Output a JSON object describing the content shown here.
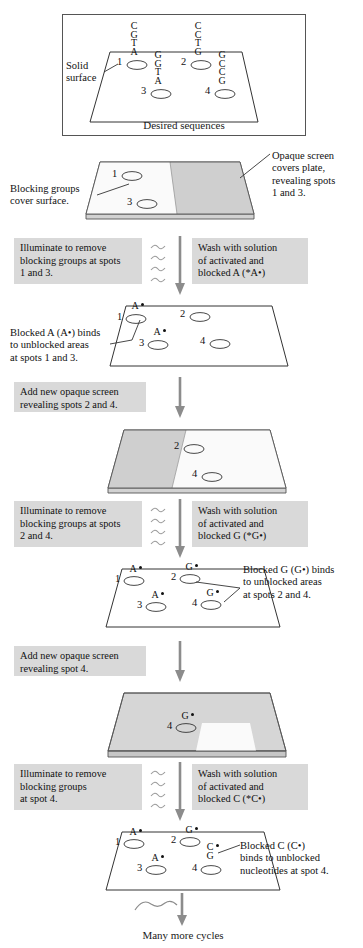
{
  "figure": {
    "bottom_note": "Many more cycles"
  },
  "panel1": {
    "name": "desired-sequences-panel",
    "caption": "Desired sequences",
    "label_solid_surface": "Solid\nsurface",
    "label_solid_surface_line1": "Solid",
    "label_solid_surface_line2": "surface",
    "spots": [
      {
        "id": "1",
        "number": "1",
        "sequence": "C\nG\nT\nA"
      },
      {
        "id": "2",
        "number": "2",
        "sequence": "C\nC\nT\nG"
      },
      {
        "id": "3",
        "number": "3",
        "sequence": "G\nG\nT\nA"
      },
      {
        "id": "4",
        "number": "4",
        "sequence": "G\nC\nC\nG"
      }
    ]
  },
  "panel2": {
    "name": "first-mask-panel",
    "label_blocking_line1": "Blocking groups",
    "label_blocking_line2": "cover surface.",
    "label_screen_line1": "Opaque screen",
    "label_screen_line2": "covers plate,",
    "label_screen_line3": "revealing spots",
    "label_screen_line4": "1 and 3.",
    "spots": [
      {
        "number": "1"
      },
      {
        "number": "3"
      }
    ]
  },
  "step1": {
    "illuminate_line1": "Illuminate to remove",
    "illuminate_line2": "blocking groups at spots",
    "illuminate_line3": "1 and 3.",
    "wash_line1": "Wash with solution",
    "wash_line2": "of activated and",
    "wash_line3": "blocked A (*A•)"
  },
  "panel3": {
    "name": "a-bound-panel",
    "label_line1": "Blocked A (A•) binds",
    "label_line2": "to unblocked areas",
    "label_line3": "at spots 1 and 3.",
    "spots": [
      {
        "number": "1",
        "base": "A",
        "dot": true
      },
      {
        "number": "2",
        "base": "",
        "dot": false
      },
      {
        "number": "3",
        "base": "A",
        "dot": true
      },
      {
        "number": "4",
        "base": "",
        "dot": false
      }
    ]
  },
  "step2": {
    "box_line1": "Add new opaque screen",
    "box_line2": "revealing spots 2 and 4."
  },
  "panel4": {
    "name": "second-mask-panel",
    "spots": [
      {
        "number": "2"
      },
      {
        "number": "4"
      }
    ]
  },
  "step3": {
    "illuminate_line1": "Illuminate to remove",
    "illuminate_line2": "blocking groups at spots",
    "illuminate_line3": "2 and 4.",
    "wash_line1": "Wash with solution",
    "wash_line2": "of activated and",
    "wash_line3": "blocked G (*G•)"
  },
  "panel5": {
    "name": "g-bound-panel",
    "label_line1": "Blocked G (G•) binds",
    "label_line2": "to unblocked areas",
    "label_line3": "at spots 2 and 4.",
    "spots": [
      {
        "number": "1",
        "base": "A",
        "dot": true
      },
      {
        "number": "2",
        "base": "G",
        "dot": true
      },
      {
        "number": "3",
        "base": "A",
        "dot": true
      },
      {
        "number": "4",
        "base": "G",
        "dot": true
      }
    ]
  },
  "step4": {
    "box_line1": "Add new opaque screen",
    "box_line2": "revealing spot 4."
  },
  "panel6": {
    "name": "third-mask-panel",
    "spots": [
      {
        "number": "4",
        "base": "G",
        "dot": true
      }
    ]
  },
  "step5": {
    "illuminate_line1": "Illuminate to remove",
    "illuminate_line2": "blocking groups",
    "illuminate_line3": "at spot 4.",
    "wash_line1": "Wash with solution",
    "wash_line2": "of activated and",
    "wash_line3": "blocked C (*C•)"
  },
  "panel7": {
    "name": "c-bound-panel",
    "label_line1": "Blocked C (C•)",
    "label_line2": "binds to unblocked",
    "label_line3": "nucleotides at spot 4.",
    "spots": [
      {
        "number": "1",
        "base": "A",
        "dot": true
      },
      {
        "number": "2",
        "base": "G",
        "dot": true
      },
      {
        "number": "3",
        "base": "A",
        "dot": true
      },
      {
        "number": "4",
        "base": "C\nG",
        "dot": true
      }
    ]
  },
  "colors": {
    "box_gray": "#d9d9d9",
    "plate_light": "#f2f2f2",
    "plate_screen": "#cfcfcf",
    "plate_edge": "#555555",
    "arrow_gray": "#8c8c8c",
    "ink": "#111111"
  }
}
